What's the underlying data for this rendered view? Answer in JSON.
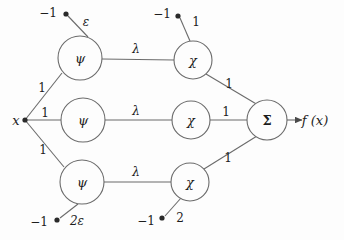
{
  "diagram": {
    "input": {
      "label": "x",
      "x": 16,
      "y": 120
    },
    "output": {
      "label": "f (x)",
      "x": 315,
      "y": 120
    },
    "hidden_layer_1": [
      {
        "name": "psi-top",
        "label": "ψ",
        "x": 80,
        "y": 58,
        "r": 22
      },
      {
        "name": "psi-middle",
        "label": "ψ",
        "x": 83,
        "y": 120,
        "r": 22
      },
      {
        "name": "psi-bottom",
        "label": "ψ",
        "x": 82,
        "y": 182,
        "r": 22
      }
    ],
    "hidden_layer_2": [
      {
        "name": "chi-top",
        "label": "χ",
        "x": 193,
        "y": 60,
        "r": 19
      },
      {
        "name": "chi-middle",
        "label": "χ",
        "x": 191,
        "y": 120,
        "r": 19
      },
      {
        "name": "chi-bottom",
        "label": "χ",
        "x": 190,
        "y": 182,
        "r": 19
      }
    ],
    "sum_node": {
      "name": "sigma",
      "label": "Σ",
      "x": 267,
      "y": 120,
      "r": 20
    },
    "bias_nodes": [
      {
        "name": "bias-psi-top",
        "label": "−1",
        "dot_x": 66,
        "dot_y": 14,
        "text_x": 48,
        "text_y": 13
      },
      {
        "name": "bias-psi-bottom",
        "label": "−1",
        "dot_x": 57,
        "dot_y": 220,
        "text_x": 39,
        "text_y": 222
      },
      {
        "name": "bias-chi-top",
        "label": "−1",
        "dot_x": 178,
        "dot_y": 16,
        "text_x": 162,
        "text_y": 14
      },
      {
        "name": "bias-chi-bottom",
        "label": "−1",
        "dot_x": 162,
        "dot_y": 218,
        "text_x": 146,
        "text_y": 221
      }
    ],
    "edge_labels": [
      {
        "name": "weight-x-to-psi-top",
        "text": "1",
        "x": 42,
        "y": 88
      },
      {
        "name": "weight-x-to-psi-middle",
        "text": "1",
        "x": 45,
        "y": 113
      },
      {
        "name": "weight-x-to-psi-bottom",
        "text": "1",
        "x": 43,
        "y": 150
      },
      {
        "name": "weight-bias-psi-top",
        "text": "ε",
        "x": 86,
        "y": 22
      },
      {
        "name": "weight-bias-psi-bottom",
        "text": "2ε",
        "x": 77,
        "y": 221
      },
      {
        "name": "weight-psi-top-to-chi-top",
        "text": "λ",
        "x": 136,
        "y": 49
      },
      {
        "name": "weight-psi-middle-to-chi-middle",
        "text": "λ",
        "x": 136,
        "y": 111
      },
      {
        "name": "weight-psi-bottom-to-chi-bottom",
        "text": "λ",
        "x": 136,
        "y": 172
      },
      {
        "name": "weight-bias-chi-top",
        "text": "1",
        "x": 196,
        "y": 22
      },
      {
        "name": "weight-bias-chi-bottom",
        "text": "2",
        "x": 180,
        "y": 218
      },
      {
        "name": "weight-chi-top-to-sigma",
        "text": "1",
        "x": 229,
        "y": 84
      },
      {
        "name": "weight-chi-middle-to-sigma",
        "text": "1",
        "x": 226,
        "y": 112
      },
      {
        "name": "weight-chi-bottom-to-sigma",
        "text": "1",
        "x": 228,
        "y": 158
      }
    ]
  }
}
